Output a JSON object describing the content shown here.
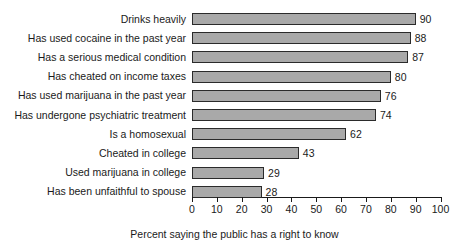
{
  "chart_data": {
    "type": "bar",
    "orientation": "horizontal",
    "title": "",
    "xlabel": "Percent saying the public has a right to know",
    "ylabel": "",
    "xlim": [
      0,
      100
    ],
    "xticks": [
      0,
      10,
      20,
      30,
      40,
      50,
      60,
      70,
      80,
      90,
      100
    ],
    "grid": false,
    "legend": false,
    "categories": [
      "Drinks heavily",
      "Has used cocaine in the past year",
      "Has a serious medical condition",
      "Has cheated on income taxes",
      "Has used marijuana in the past year",
      "Has undergone psychiatric treatment",
      "Is a homosexual",
      "Cheated in college",
      "Used marijuana in college",
      "Has been unfaithful to spouse"
    ],
    "values": [
      90,
      88,
      87,
      80,
      76,
      74,
      62,
      43,
      29,
      28
    ],
    "data_labels": [
      "90",
      "88",
      "87",
      "80",
      "76",
      "74",
      "62",
      "43",
      "29",
      "28"
    ],
    "colors": {
      "bar_fill": "#a9a9a9",
      "bar_border": "#2b2b2b",
      "text": "#1a1a1a",
      "background": "#ffffff"
    }
  }
}
